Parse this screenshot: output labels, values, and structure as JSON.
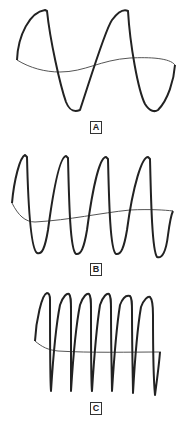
{
  "figure": {
    "stroke_color": "#222222",
    "baseline_color": "#555555",
    "panels": [
      {
        "label": "A",
        "cycles": 2,
        "waveform": "M17,60 C18,35 30,12 45,10 L47,11 C50,40 60,85 66,102 C70,112 75,112 80,110 C90,80 105,30 112,20 C118,12 124,9 128,11 C130,45 138,90 145,104 C150,112 155,112 158,110 C168,100 174,80 175,65",
        "baseline": "M17,60 C30,68 45,72 60,72 C85,72 100,60 130,58 C150,57 170,58 175,65"
      },
      {
        "label": "B",
        "cycles": 4,
        "waveform": "M12,203 C14,180 20,157 25,155 L27,157 C28,200 30,248 37,253 C42,255 45,248 48,230 C54,185 60,157 66,156 L68,158 C69,200 70,250 76,254 C81,255 84,248 87,230 C93,185 100,157 106,157 L108,159 C109,200 110,250 116,254 C121,255 124,248 127,230 C133,185 142,157 148,157 L150,159 C151,200 152,250 157,257 C162,259 166,252 168,235 C170,220 172,213 173,211",
        "baseline": "M12,203 C18,215 25,222 35,222 C70,220 100,213 130,210 C150,209 165,210 173,211"
      },
      {
        "label": "C",
        "cycles": 6,
        "waveform": "M35,341 C36,320 42,294 47,293 C49,293 50,295 50,300 C50,340 50,380 51,391 C52,375 55,330 60,305 C63,296 67,293 69,294 C71,296 71,300 71,310 C71,350 71,385 71,391 C72,375 75,330 80,305 C83,296 87,293 89,294 C91,296 91,300 91,310 C91,350 91,385 92,391 C93,375 96,330 100,305 C103,296 107,293 109,294 C111,296 111,300 111,310 C111,350 112,385 112,391 C113,375 116,330 120,305 C123,297 127,295 130,296 C132,298 132,302 132,312 C132,350 133,385 133,393 C134,375 137,330 141,307 C144,299 148,296 150,297 C152,299 153,305 153,315 C153,350 154,385 155,395 C157,380 159,365 160,352",
        "baseline": "M35,341 C42,347 48,350 58,351 C90,353 130,352 161,352"
      }
    ]
  }
}
